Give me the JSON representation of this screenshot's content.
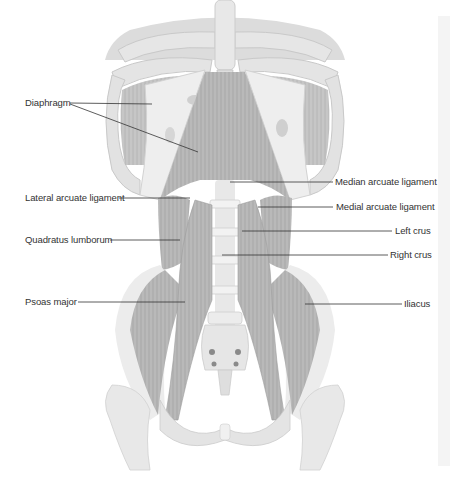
{
  "diagram": {
    "colors": {
      "background": "#ffffff",
      "muscle": "#b8b8b8",
      "muscle_dark": "#9a9a9a",
      "bone": "#e2e2e2",
      "bone_shadow": "#cfcfcf",
      "leader_line": "#333333",
      "label_text": "#333333",
      "side_strip": "#f4f4f4"
    },
    "labels": {
      "left": [
        {
          "id": "diaphragm",
          "text": "Diaphragm"
        },
        {
          "id": "lateral_arcuate_ligament",
          "text": "Lateral arcuate ligament"
        },
        {
          "id": "quadratus_lumborum",
          "text": "Quadratus lumborum"
        },
        {
          "id": "psoas_major",
          "text": "Psoas major"
        }
      ],
      "right": [
        {
          "id": "median_arcuate_ligament",
          "text": "Median arcuate ligament"
        },
        {
          "id": "medial_arcuate_ligament",
          "text": "Medial arcuate ligament"
        },
        {
          "id": "left_crus",
          "text": "Left crus"
        },
        {
          "id": "right_crus",
          "text": "Right crus"
        },
        {
          "id": "iliacus",
          "text": "Iliacus"
        }
      ]
    }
  }
}
